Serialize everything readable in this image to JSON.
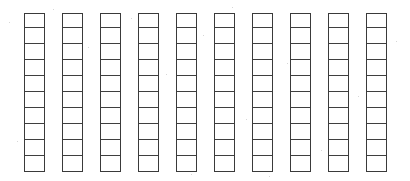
{
  "document": {
    "title": "Base-Ten Unit Bars",
    "kind": "manipulative-diagram",
    "background_color": "#ffffff"
  },
  "chart_data": {
    "type": "table",
    "xlabel": "",
    "ylabel": "",
    "bar_count": 10,
    "cells_per_bar": 10,
    "total_units": 100,
    "categories": [
      "bar-1",
      "bar-2",
      "bar-3",
      "bar-4",
      "bar-5",
      "bar-6",
      "bar-7",
      "bar-8",
      "bar-9",
      "bar-10"
    ],
    "values": [
      10,
      10,
      10,
      10,
      10,
      10,
      10,
      10,
      10,
      10
    ],
    "filled_values": [
      0,
      0,
      0,
      0,
      0,
      0,
      0,
      0,
      0,
      0
    ]
  },
  "style": {
    "stroke_color": "#3a3a3a",
    "inner_rule_color": "#3f3f3f",
    "cell_fill": "#ffffff",
    "stroke_width_px": 1.5
  },
  "geometry": {
    "canvas_width": 410,
    "canvas_height": 181,
    "bar_top": 13,
    "bar_height": 159,
    "bar_width": 21,
    "bar_pitch": 38,
    "first_bar_left": 24,
    "bar_lefts": [
      24,
      62,
      100,
      138,
      176,
      214,
      252,
      290,
      328,
      366
    ]
  }
}
